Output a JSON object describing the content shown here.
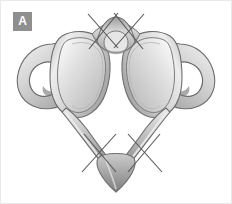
{
  "figure": {
    "panel_label": "A",
    "background_color": "#ffffff",
    "frame_color": "#e9e9e9",
    "badge": {
      "text": "A",
      "background_color": "#8f8f8f",
      "text_color": "#ffffff"
    },
    "bone": {
      "fill_light": "#f2f2f2",
      "fill_mid": "#c9c9c9",
      "fill_shadow": "#9a9a9a",
      "outline_color": "#6e6e6e"
    },
    "annotations": {
      "mark_color": "#555555",
      "marks": [
        {
          "name": "x-mark-anterior-left",
          "cx": 103,
          "cy": 30
        },
        {
          "name": "x-mark-anterior-right",
          "cx": 138,
          "cy": 30
        },
        {
          "name": "x-mark-posterior-left",
          "cx": 99,
          "cy": 152
        },
        {
          "name": "x-mark-posterior-right",
          "cx": 145,
          "cy": 152
        }
      ]
    },
    "structures": [
      {
        "name": "superior-articular-facet-left"
      },
      {
        "name": "superior-articular-facet-right"
      },
      {
        "name": "transverse-foramen-left"
      },
      {
        "name": "transverse-foramen-right"
      },
      {
        "name": "anterior-arch"
      },
      {
        "name": "anterior-tubercle"
      },
      {
        "name": "posterior-arch"
      },
      {
        "name": "posterior-tubercle"
      },
      {
        "name": "transverse-process-left"
      },
      {
        "name": "transverse-process-right"
      }
    ]
  }
}
